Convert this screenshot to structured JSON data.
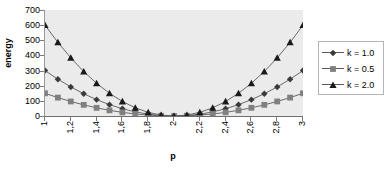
{
  "chart_data": {
    "type": "line",
    "title": "",
    "xlabel": "p",
    "ylabel": "energy",
    "xlim": [
      1,
      3
    ],
    "ylim": [
      0,
      700
    ],
    "grid": false,
    "legend_position": "right",
    "x": [
      1,
      1.1,
      1.2,
      1.3,
      1.4,
      1.5,
      1.6,
      1.7,
      1.8,
      1.9,
      2,
      2.1,
      2.2,
      2.3,
      2.4,
      2.5,
      2.6,
      2.7,
      2.8,
      2.9,
      3
    ],
    "xtick_labels": [
      "1",
      "1,2",
      "1,4",
      "1,6",
      "1,8",
      "2",
      "2,2",
      "2,4",
      "2,6",
      "2,8",
      "3"
    ],
    "xtick_values": [
      1,
      1.2,
      1.4,
      1.6,
      1.8,
      2,
      2.2,
      2.4,
      2.6,
      2.8,
      3
    ],
    "ytick_labels": [
      "0",
      "100",
      "200",
      "300",
      "400",
      "500",
      "600",
      "700"
    ],
    "ytick_values": [
      0,
      100,
      200,
      300,
      400,
      500,
      600,
      700
    ],
    "series": [
      {
        "name": "k = 1.0",
        "marker": "diamond",
        "color": "#3a3a3a",
        "values": [
          300,
          243,
          192,
          147,
          108,
          75,
          48,
          27,
          12,
          3,
          0,
          3,
          12,
          27,
          48,
          75,
          108,
          147,
          192,
          243,
          300
        ]
      },
      {
        "name": "k = 0.5",
        "marker": "square",
        "color": "#808080",
        "values": [
          150,
          121.5,
          96,
          73.5,
          54,
          37.5,
          24,
          13.5,
          6,
          1.5,
          0,
          1.5,
          6,
          13.5,
          24,
          37.5,
          54,
          73.5,
          96,
          121.5,
          150
        ]
      },
      {
        "name": "k = 2.0",
        "marker": "triangle",
        "color": "#1a1a1a",
        "values": [
          600,
          486,
          384,
          294,
          216,
          150,
          96,
          54,
          24,
          6,
          0,
          6,
          24,
          54,
          96,
          150,
          216,
          294,
          384,
          486,
          600
        ]
      }
    ]
  },
  "axes": {
    "y_title": "energy",
    "x_title": "p"
  },
  "legend": {
    "entries": [
      {
        "label": "k = 1.0"
      },
      {
        "label": "k = 0.5"
      },
      {
        "label": "k = 2.0"
      }
    ]
  },
  "colors": {
    "plot_background": "#ebebeb",
    "page_background": "#ffffff",
    "axis": "#6f6f6f",
    "legend_border": "#b5b5b5"
  }
}
